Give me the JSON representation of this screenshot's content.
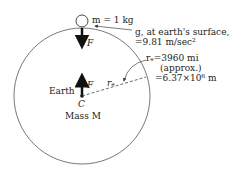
{
  "labels": {
    "mass": "m = 1 kg",
    "g_line1": "g, at earth's surface,",
    "g_line2": "=9.81 m/sec²",
    "re_line1": "rₑ=3960 mi",
    "re_line2": "(approx.)",
    "re_line3": "=6.37×10⁶ m",
    "force_top": "F",
    "force_center": "F",
    "earth": "Earth",
    "center": "C",
    "mass_M": "Mass M",
    "radius": "rₑ"
  },
  "colors": {
    "line": "#333333",
    "arrow": "#111111"
  }
}
